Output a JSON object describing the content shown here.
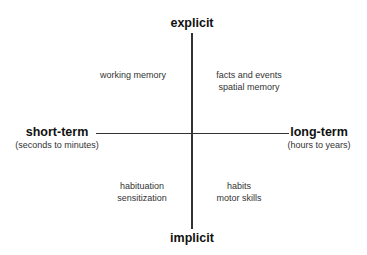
{
  "diagram": {
    "type": "quadrant-axes",
    "axes": {
      "top": {
        "label": "explicit"
      },
      "bottom": {
        "label": "implicit"
      },
      "left": {
        "label": "short-term",
        "sublabel": "(seconds to minutes)"
      },
      "right": {
        "label": "long-term",
        "sublabel": "(hours to years)"
      }
    },
    "quadrants": {
      "top_left": {
        "lines": [
          "working memory"
        ]
      },
      "top_right": {
        "lines": [
          "facts and events",
          "spatial memory"
        ]
      },
      "bottom_left": {
        "lines": [
          "habituation",
          "sensitization"
        ]
      },
      "bottom_right": {
        "lines": [
          "habits",
          "motor skills"
        ]
      }
    },
    "colors": {
      "line": "#333333",
      "text": "#111111",
      "subtext": "#333333",
      "background": "#ffffff"
    }
  }
}
